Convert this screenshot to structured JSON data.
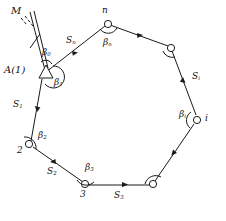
{
  "figure": {
    "name": "closed-polygon-traverse-diagram",
    "stroke_color": "#1a1a1a",
    "background": "#ffffff"
  },
  "reference": {
    "meridian_label": "M",
    "station_label": "A(1)",
    "station_marker": "triangle-marker-icon"
  },
  "vertices": [
    {
      "id": "v-a1",
      "label": "A(1)",
      "marker": "triangle"
    },
    {
      "id": "v-2",
      "label": "2",
      "marker": "circle"
    },
    {
      "id": "v-3",
      "label": "3",
      "marker": "circle"
    },
    {
      "id": "v-br",
      "label": "",
      "marker": "circle"
    },
    {
      "id": "v-i",
      "label": "i",
      "marker": "circle"
    },
    {
      "id": "v-tr",
      "label": "",
      "marker": "circle"
    },
    {
      "id": "v-n",
      "label": "n",
      "marker": "circle"
    }
  ],
  "angles": [
    {
      "id": "beta-0",
      "base": "β",
      "sub": "0"
    },
    {
      "id": "beta-1",
      "base": "β",
      "sub": "1"
    },
    {
      "id": "beta-2",
      "base": "β",
      "sub": "2"
    },
    {
      "id": "beta-3",
      "base": "β",
      "sub": "3"
    },
    {
      "id": "beta-i",
      "base": "β",
      "sub": "i"
    },
    {
      "id": "beta-n",
      "base": "β",
      "sub": "n"
    }
  ],
  "sides": [
    {
      "id": "side-1",
      "base": "S",
      "sub": "1"
    },
    {
      "id": "side-2",
      "base": "S",
      "sub": "2"
    },
    {
      "id": "side-3",
      "base": "S",
      "sub": "3"
    },
    {
      "id": "side-i",
      "base": "S",
      "sub": "i"
    },
    {
      "id": "side-n",
      "base": "S",
      "sub": "n"
    }
  ],
  "labels": {
    "M": "M",
    "A1": "A(1)",
    "n": "n",
    "i": "i",
    "two": "2",
    "three": "3",
    "beta0": "β",
    "beta0_sub": "0",
    "beta1": "β",
    "beta1_sub": "1",
    "beta2": "β",
    "beta2_sub": "2",
    "beta3": "β",
    "beta3_sub": "3",
    "betai": "β",
    "betai_sub": "i",
    "betan": "β",
    "betan_sub": "n",
    "S1": "S",
    "S1_sub": "1",
    "S2": "S",
    "S2_sub": "2",
    "S3": "S",
    "S3_sub": "3",
    "Si": "S",
    "Si_sub": "i",
    "Sn": "S",
    "Sn_sub": "n"
  }
}
